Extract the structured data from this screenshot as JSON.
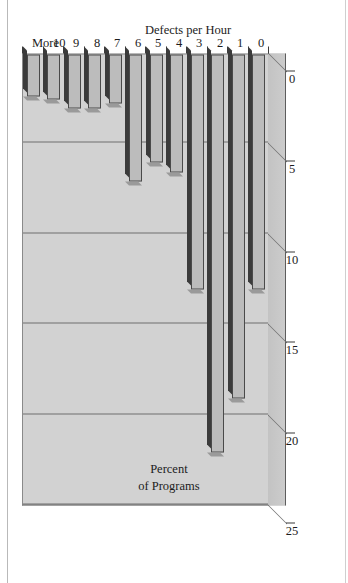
{
  "chart_data": {
    "type": "bar",
    "title": "",
    "orientation": "vertical-rotated",
    "xlabel": "Defects per Hour",
    "ylabel": "Percent of Programs",
    "ylabel_lines": [
      "Percent",
      "of Programs"
    ],
    "categories": [
      "0",
      "1",
      "2",
      "3",
      "4",
      "5",
      "6",
      "7",
      "8",
      "9",
      "10",
      "More"
    ],
    "values": [
      13,
      19,
      22,
      13,
      6.5,
      6,
      7,
      2.7,
      3,
      3,
      2.5,
      2.3
    ],
    "ytick_labels": [
      "0",
      "5",
      "10",
      "15",
      "20",
      "25"
    ],
    "ytick_values": [
      0,
      5,
      10,
      15,
      20,
      25
    ],
    "ylim": [
      0,
      25
    ],
    "grid": true,
    "legend": false,
    "style": "3d-bar",
    "colors": {
      "bar_face": "#bcbcbc",
      "bar_top": "#3b3b3b",
      "bar_side": "#9a9a9a",
      "plot_background": "#d2d2d2",
      "gridline": "#6f6f6f",
      "axis": "#3a3a3a",
      "text": "#1c1c1c",
      "page_background": "#ffffff"
    }
  }
}
